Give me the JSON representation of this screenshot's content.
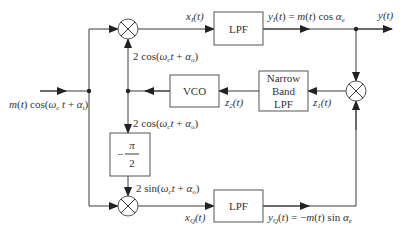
{
  "diagram": {
    "colors": {
      "line": "#3a3a3a",
      "box_border": "#555555",
      "text": "#333333",
      "background": "#ffffff"
    },
    "input": {
      "label": "m(t) cos(ω_c t + α_i)",
      "label_parts": [
        "m(t) cos(ω",
        "c",
        "t + α",
        "i",
        ")"
      ]
    },
    "blocks": {
      "lpf_top": {
        "label": "LPF"
      },
      "lpf_bottom": {
        "label": "LPF"
      },
      "vco": {
        "label": "VCO"
      },
      "narrow_band_lpf": {
        "lines": [
          "Narrow",
          "Band",
          "LPF"
        ]
      },
      "phase_shift": {
        "numerator": "π",
        "denominator": "2",
        "sign": "−"
      },
      "multiplier_top": {
        "symbol": "⊗"
      },
      "multiplier_bottom": {
        "symbol": "⊗"
      },
      "multiplier_right": {
        "symbol": "⊗"
      }
    },
    "signals": {
      "x_I": {
        "label": "x_I(t)",
        "parts": [
          "x",
          "I",
          "(t)"
        ]
      },
      "y_I": {
        "label": "y_I(t) = m(t) cos α_e",
        "parts": [
          "y",
          "I",
          "(t) = m(t) cos α",
          "e"
        ]
      },
      "y": {
        "label": "y(t)"
      },
      "cos_top": {
        "label": "2 cos(ω_c t + α_o)",
        "parts": [
          "2 cos(ω",
          "c",
          "t + α",
          "o",
          ")"
        ]
      },
      "cos_mid": {
        "label": "2 cos(ω_c t + α_o)",
        "parts": [
          "2 cos(ω",
          "c",
          "t + α",
          "o",
          ")"
        ]
      },
      "sin_bottom": {
        "label": "2 sin(ω_c t + α_o)",
        "parts": [
          "2 sin(ω",
          "c",
          "t + α",
          "o",
          ")"
        ]
      },
      "z_1": {
        "label": "z_1(t)",
        "parts": [
          "z",
          "1",
          "(t)"
        ]
      },
      "z_2": {
        "label": "z_2(t)",
        "parts": [
          "z",
          "2",
          "(t)"
        ]
      },
      "x_Q": {
        "label": "x_Q(t)",
        "parts": [
          "x",
          "Q",
          "(t)"
        ]
      },
      "y_Q": {
        "label": "y_Q(t) = −m(t) sin α_e",
        "parts": [
          "y",
          "Q",
          "(t) = −m(t) sin α",
          "e"
        ]
      }
    }
  }
}
